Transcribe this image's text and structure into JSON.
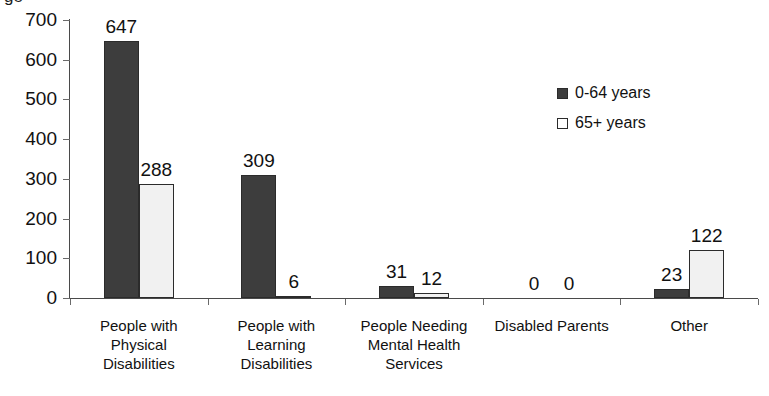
{
  "chart_data": {
    "type": "bar",
    "title": "",
    "title_remnant": "ge",
    "xlabel": "",
    "ylabel": "",
    "ylim": [
      0,
      700
    ],
    "yticks": [
      0,
      100,
      200,
      300,
      400,
      500,
      600,
      700
    ],
    "grid": false,
    "legend_position": "inside-upper-right",
    "categories": [
      "People with Physical Disabilities",
      "People with Learning Disabilities",
      "People Needing Mental Health Services",
      "Disabled Parents",
      "Other"
    ],
    "category_lines": [
      [
        "People with",
        "Physical",
        "Disabilities"
      ],
      [
        "People with",
        "Learning",
        "Disabilities"
      ],
      [
        "People Needing",
        "Mental Health",
        "Services"
      ],
      [
        "Disabled Parents"
      ],
      [
        "Other"
      ]
    ],
    "series": [
      {
        "name": "0-64 years",
        "color": "#3d3d3d",
        "values": [
          647,
          309,
          31,
          0,
          23
        ]
      },
      {
        "name": "65+ years",
        "color": "#f1f1f1",
        "values": [
          288,
          6,
          12,
          0,
          122
        ]
      }
    ],
    "data_labels": [
      [
        "647",
        "288"
      ],
      [
        "309",
        "6"
      ],
      [
        "31",
        "12"
      ],
      [
        "0",
        "0"
      ],
      [
        "23",
        "122"
      ]
    ]
  },
  "legend": {
    "items": [
      {
        "label": "0-64 years",
        "swatch": "filled-dark-square"
      },
      {
        "label": "65+ years",
        "swatch": "outline-white-square"
      }
    ]
  },
  "axis": {
    "y_tick_labels": [
      "700",
      "600",
      "500",
      "400",
      "300",
      "200",
      "100",
      "0"
    ]
  }
}
